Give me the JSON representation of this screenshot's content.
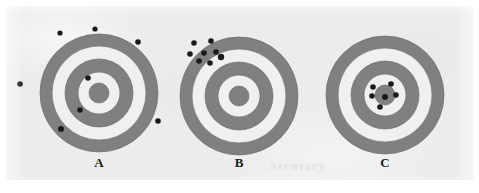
{
  "figure": {
    "width": 479,
    "height": 193,
    "background_color": "#ffffff",
    "panel_color": "#ececec",
    "ring_color": "#808080",
    "ring_gap_color": "#f0f0f0",
    "bullseye_color": "#808080",
    "shot_color": "#1a1a1a",
    "outline_color": "#6e6e6e",
    "ghost_artifact_text": "Accuracy"
  },
  "targets": [
    {
      "id": "target-a",
      "label": "A",
      "label_x": 99,
      "label_y": 163,
      "center": {
        "x": 99,
        "y": 93
      },
      "ring_radii": [
        59,
        47,
        34,
        21,
        10
      ],
      "shot_count": 8,
      "description": "shots widely scattered across and off the target",
      "shots": [
        {
          "x": 60,
          "y": 33,
          "r": 2.6
        },
        {
          "x": 95,
          "y": 29,
          "r": 2.6
        },
        {
          "x": 138,
          "y": 42,
          "r": 2.8
        },
        {
          "x": 20,
          "y": 84,
          "r": 2.8
        },
        {
          "x": 88,
          "y": 78,
          "r": 2.8
        },
        {
          "x": 80,
          "y": 110,
          "r": 2.8
        },
        {
          "x": 61,
          "y": 129,
          "r": 3.0
        },
        {
          "x": 158,
          "y": 121,
          "r": 2.8
        }
      ]
    },
    {
      "id": "target-b",
      "label": "B",
      "label_x": 239,
      "label_y": 163,
      "center": {
        "x": 239,
        "y": 96
      },
      "ring_radii": [
        59,
        47,
        34,
        21,
        10
      ],
      "shot_count": 8,
      "description": "shots tightly clustered but far from the center, upper-left",
      "shots": [
        {
          "x": 194,
          "y": 43,
          "r": 2.8
        },
        {
          "x": 211,
          "y": 41,
          "r": 2.8
        },
        {
          "x": 190,
          "y": 54,
          "r": 2.8
        },
        {
          "x": 204,
          "y": 53,
          "r": 2.8
        },
        {
          "x": 216,
          "y": 52,
          "r": 2.8
        },
        {
          "x": 199,
          "y": 61,
          "r": 2.8
        },
        {
          "x": 210,
          "y": 63,
          "r": 2.8
        },
        {
          "x": 221,
          "y": 57,
          "r": 3.2
        }
      ]
    },
    {
      "id": "target-c",
      "label": "C",
      "label_x": 385,
      "label_y": 163,
      "center": {
        "x": 385,
        "y": 95
      },
      "ring_radii": [
        59,
        47,
        34,
        21,
        10
      ],
      "shot_count": 6,
      "description": "shots tightly clustered on the bullseye",
      "shots": [
        {
          "x": 373,
          "y": 87,
          "r": 2.8
        },
        {
          "x": 391,
          "y": 84,
          "r": 2.8
        },
        {
          "x": 372,
          "y": 96,
          "r": 2.8
        },
        {
          "x": 385,
          "y": 97,
          "r": 3.0
        },
        {
          "x": 396,
          "y": 95,
          "r": 2.8
        },
        {
          "x": 380,
          "y": 107,
          "r": 2.8
        }
      ]
    }
  ]
}
